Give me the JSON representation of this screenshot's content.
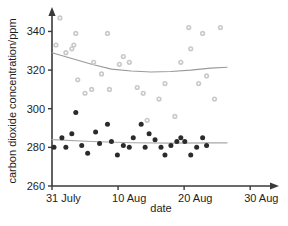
{
  "chart_data": {
    "type": "scatter",
    "title": "",
    "xlabel": "date",
    "ylabel": "carbon dioxide concentration/ppm",
    "xlim": [
      0,
      33
    ],
    "ylim": [
      260,
      348
    ],
    "grid": false,
    "legend": "none",
    "y_ticks": [
      260,
      280,
      300,
      320,
      340
    ],
    "x_ticks": [
      {
        "value": 0,
        "label": "31 July"
      },
      {
        "value": 10,
        "label": "10  Aug"
      },
      {
        "value": 20,
        "label": "20  Aug"
      },
      {
        "value": 30,
        "label": "30  Aug"
      }
    ],
    "colors": {
      "upper_points": "#c9c9c9",
      "lower_points": "#2b2b2b",
      "upper_trend": "#9a9a9a",
      "lower_trend": "#a8a8a8",
      "axis": "#3a3a3a"
    },
    "series": [
      {
        "name": "upper series",
        "marker": "circle-light",
        "color": "#c9c9c9",
        "points": [
          {
            "x": 1.2,
            "y": 347
          },
          {
            "x": 0.6,
            "y": 333
          },
          {
            "x": 2.1,
            "y": 329
          },
          {
            "x": 3.0,
            "y": 331
          },
          {
            "x": 3.3,
            "y": 333
          },
          {
            "x": 3.6,
            "y": 339
          },
          {
            "x": 3.9,
            "y": 315
          },
          {
            "x": 5.0,
            "y": 308
          },
          {
            "x": 6.0,
            "y": 310
          },
          {
            "x": 6.3,
            "y": 324
          },
          {
            "x": 7.5,
            "y": 318
          },
          {
            "x": 8.4,
            "y": 339
          },
          {
            "x": 8.7,
            "y": 310
          },
          {
            "x": 10.2,
            "y": 323
          },
          {
            "x": 10.8,
            "y": 327
          },
          {
            "x": 11.7,
            "y": 324
          },
          {
            "x": 12.9,
            "y": 311
          },
          {
            "x": 13.8,
            "y": 308
          },
          {
            "x": 14.4,
            "y": 294
          },
          {
            "x": 16.2,
            "y": 305
          },
          {
            "x": 17.1,
            "y": 313
          },
          {
            "x": 18.6,
            "y": 296
          },
          {
            "x": 19.5,
            "y": 324
          },
          {
            "x": 20.7,
            "y": 342
          },
          {
            "x": 21.0,
            "y": 331
          },
          {
            "x": 22.2,
            "y": 313
          },
          {
            "x": 22.8,
            "y": 339
          },
          {
            "x": 23.4,
            "y": 317
          },
          {
            "x": 24.6,
            "y": 305
          },
          {
            "x": 25.5,
            "y": 342
          }
        ]
      },
      {
        "name": "lower series",
        "marker": "circle-dark",
        "color": "#2b2b2b",
        "points": [
          {
            "x": 0.3,
            "y": 280
          },
          {
            "x": 1.5,
            "y": 285
          },
          {
            "x": 2.1,
            "y": 280
          },
          {
            "x": 3.0,
            "y": 287
          },
          {
            "x": 3.6,
            "y": 298
          },
          {
            "x": 4.5,
            "y": 281
          },
          {
            "x": 5.4,
            "y": 277
          },
          {
            "x": 6.6,
            "y": 288
          },
          {
            "x": 7.2,
            "y": 282
          },
          {
            "x": 8.4,
            "y": 292
          },
          {
            "x": 9.0,
            "y": 283
          },
          {
            "x": 9.9,
            "y": 276
          },
          {
            "x": 10.8,
            "y": 281
          },
          {
            "x": 11.7,
            "y": 280
          },
          {
            "x": 12.3,
            "y": 285
          },
          {
            "x": 13.5,
            "y": 292
          },
          {
            "x": 14.1,
            "y": 280
          },
          {
            "x": 14.7,
            "y": 287
          },
          {
            "x": 15.6,
            "y": 284
          },
          {
            "x": 16.5,
            "y": 280
          },
          {
            "x": 17.1,
            "y": 276
          },
          {
            "x": 18.0,
            "y": 281
          },
          {
            "x": 18.9,
            "y": 283
          },
          {
            "x": 19.5,
            "y": 285
          },
          {
            "x": 20.1,
            "y": 283
          },
          {
            "x": 21.0,
            "y": 276
          },
          {
            "x": 21.9,
            "y": 280
          },
          {
            "x": 22.8,
            "y": 285
          },
          {
            "x": 23.4,
            "y": 281
          }
        ]
      }
    ],
    "trend_lines": [
      {
        "name": "upper trend",
        "color": "#9a9a9a",
        "points": [
          {
            "x": 0.0,
            "y": 329
          },
          {
            "x": 3.0,
            "y": 326
          },
          {
            "x": 6.0,
            "y": 323
          },
          {
            "x": 9.0,
            "y": 320.5
          },
          {
            "x": 12.0,
            "y": 319.5
          },
          {
            "x": 15.0,
            "y": 319
          },
          {
            "x": 18.0,
            "y": 319.3
          },
          {
            "x": 21.0,
            "y": 320
          },
          {
            "x": 24.0,
            "y": 321
          },
          {
            "x": 26.5,
            "y": 321.5
          }
        ]
      },
      {
        "name": "lower trend",
        "color": "#a8a8a8",
        "points": [
          {
            "x": 0.0,
            "y": 284
          },
          {
            "x": 6.0,
            "y": 283
          },
          {
            "x": 12.0,
            "y": 282.4
          },
          {
            "x": 18.0,
            "y": 282.2
          },
          {
            "x": 24.0,
            "y": 282.3
          },
          {
            "x": 26.5,
            "y": 282.3
          }
        ]
      }
    ]
  }
}
